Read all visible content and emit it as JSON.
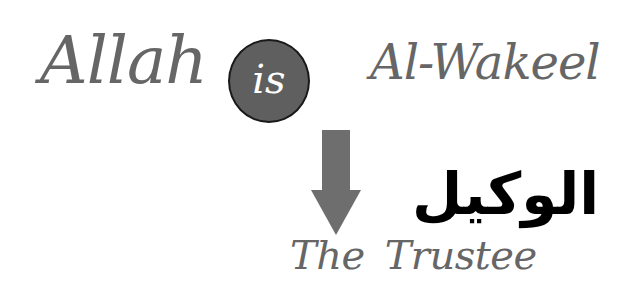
{
  "line1": {
    "word_left": "Allah",
    "circle_word": "is",
    "word_right": "Al-Wakeel"
  },
  "arrow": {
    "icon": "down-arrow-icon",
    "color": "#6e6e6e"
  },
  "arabic_term": "الوكيل",
  "translation": {
    "word1": "The",
    "word2": "Trustee"
  },
  "colors": {
    "text_gray": "#666666",
    "circle_fill": "#5f5f5f",
    "circle_border": "#1a1a1a",
    "arabic_text": "#000000"
  }
}
